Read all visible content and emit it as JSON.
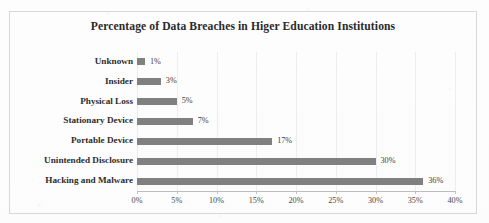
{
  "chart_data": {
    "type": "bar",
    "orientation": "horizontal",
    "title": "Percentage of Data Breaches in Higer Education Institutions",
    "xlabel": "",
    "ylabel": "",
    "categories": [
      "Unknown",
      "Insider",
      "Physical Loss",
      "Stationary Device",
      "Portable Device",
      "Unintended Disclosure",
      "Hacking and Malware"
    ],
    "values": [
      1,
      3,
      5,
      7,
      17,
      30,
      36
    ],
    "value_labels": [
      "1%",
      "3%",
      "5%",
      "7%",
      "17%",
      "30%",
      "36%"
    ],
    "xlim": [
      0,
      40
    ],
    "xticks": [
      0,
      5,
      10,
      15,
      20,
      25,
      30,
      35,
      40
    ],
    "xtick_labels": [
      "0%",
      "5%",
      "10%",
      "15%",
      "20%",
      "25%",
      "30%",
      "35%",
      "40%"
    ],
    "grid": true,
    "grid_axis": "x",
    "legend": false,
    "bar_color": "#808080",
    "axis_color": "#bdbdbd",
    "grid_color": "#ededed",
    "text_color": "#2e2e2e",
    "background": "#fdfdfd"
  }
}
